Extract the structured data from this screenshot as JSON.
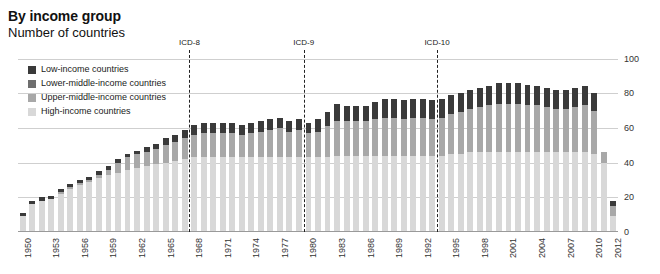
{
  "header": {
    "title": "By income group",
    "subtitle": "Number of countries"
  },
  "legend": {
    "position": "top-left-inside",
    "items": [
      {
        "label": "Low-income countries",
        "color": "#3a3a3a",
        "key": "low"
      },
      {
        "label": "Lower-middle-income countries",
        "color": "#6e6e6e",
        "key": "lower_middle"
      },
      {
        "label": "Upper-middle-income countries",
        "color": "#a8a8a8",
        "key": "upper_middle"
      },
      {
        "label": "High-income countries",
        "color": "#d8d8d8",
        "key": "high"
      }
    ]
  },
  "annotations": [
    {
      "label": "ICD-8",
      "year": 1968
    },
    {
      "label": "ICD-9",
      "year": 1980
    },
    {
      "label": "ICD-10",
      "year": 1994
    }
  ],
  "axis": {
    "y_ticks": [
      "0",
      "20",
      "40",
      "60",
      "80",
      "100"
    ],
    "y_label": "",
    "x_ticks": [
      "1950",
      "1953",
      "1956",
      "1959",
      "1962",
      "1965",
      "1968",
      "1971",
      "1974",
      "1977",
      "1980",
      "1983",
      "1986",
      "1989",
      "1992",
      "1995",
      "1998",
      "2001",
      "2004",
      "2007",
      "2010",
      "2012"
    ],
    "x_label": ""
  },
  "chart_data": {
    "type": "bar",
    "stacked": true,
    "title": "By income group",
    "subtitle": "Number of countries",
    "xlabel": "",
    "ylabel": "Number of countries",
    "ylim": [
      0,
      105
    ],
    "ytick_values": [
      0,
      20,
      40,
      60,
      80,
      100
    ],
    "grid": true,
    "legend_position": "inside top-left",
    "categories": [
      1950,
      1951,
      1952,
      1953,
      1954,
      1955,
      1956,
      1957,
      1958,
      1959,
      1960,
      1961,
      1962,
      1963,
      1964,
      1965,
      1966,
      1967,
      1968,
      1969,
      1970,
      1971,
      1972,
      1973,
      1974,
      1975,
      1976,
      1977,
      1978,
      1979,
      1980,
      1981,
      1982,
      1983,
      1984,
      1985,
      1986,
      1987,
      1988,
      1989,
      1990,
      1991,
      1992,
      1993,
      1994,
      1995,
      1996,
      1997,
      1998,
      1999,
      2000,
      2001,
      2002,
      2003,
      2004,
      2005,
      2006,
      2007,
      2008,
      2009,
      2010,
      2011,
      2012
    ],
    "series": [
      {
        "name": "High-income countries",
        "color": "#d8d8d8",
        "values": [
          9,
          16,
          18,
          19,
          22,
          25,
          27,
          29,
          31,
          33,
          34,
          36,
          37,
          38,
          39,
          40,
          41,
          42,
          43,
          43,
          43,
          43,
          43,
          43,
          43,
          43,
          43,
          43,
          43,
          43,
          43,
          43,
          43,
          44,
          44,
          44,
          44,
          44,
          44,
          44,
          44,
          44,
          44,
          44,
          44,
          45,
          45,
          46,
          46,
          46,
          46,
          46,
          46,
          46,
          46,
          46,
          46,
          46,
          46,
          46,
          45,
          40,
          9
        ]
      },
      {
        "name": "Upper-middle-income countries",
        "color": "#a8a8a8",
        "values": [
          0,
          0,
          0,
          0,
          1,
          1,
          1,
          1,
          2,
          3,
          6,
          7,
          8,
          8,
          9,
          10,
          11,
          12,
          13,
          14,
          14,
          14,
          14,
          13,
          14,
          15,
          16,
          17,
          15,
          16,
          14,
          15,
          18,
          20,
          20,
          20,
          20,
          21,
          22,
          22,
          21,
          22,
          22,
          21,
          22,
          23,
          24,
          25,
          26,
          27,
          28,
          28,
          28,
          27,
          27,
          26,
          25,
          25,
          26,
          27,
          25,
          6,
          6
        ]
      },
      {
        "name": "Lower-middle-income countries",
        "color": "#6e6e6e",
        "values": [
          0,
          0,
          0,
          0,
          0,
          0,
          0,
          0,
          0,
          0,
          0,
          0,
          0,
          0,
          0,
          0,
          0,
          0,
          0,
          0,
          0,
          0,
          0,
          0,
          0,
          0,
          0,
          0,
          0,
          0,
          0,
          0,
          0,
          0,
          0,
          0,
          0,
          0,
          0,
          0,
          0,
          0,
          0,
          0,
          0,
          0,
          0,
          0,
          0,
          0,
          0,
          0,
          0,
          0,
          0,
          0,
          0,
          0,
          0,
          0,
          0,
          0,
          0
        ]
      },
      {
        "name": "Low-income countries",
        "color": "#3a3a3a",
        "values": [
          2,
          2,
          2,
          2,
          2,
          2,
          2,
          2,
          2,
          2,
          2,
          2,
          2,
          3,
          3,
          4,
          4,
          5,
          6,
          6,
          6,
          6,
          6,
          6,
          6,
          6,
          6,
          6,
          6,
          6,
          6,
          7,
          8,
          10,
          9,
          9,
          9,
          10,
          11,
          11,
          11,
          11,
          11,
          11,
          11,
          11,
          11,
          11,
          11,
          11,
          12,
          12,
          12,
          12,
          11,
          11,
          11,
          11,
          11,
          11,
          10,
          0,
          3
        ]
      }
    ],
    "totals": [
      11,
      18,
      20,
      21,
      25,
      28,
      30,
      32,
      35,
      38,
      42,
      45,
      47,
      49,
      51,
      54,
      56,
      59,
      62,
      63,
      63,
      63,
      63,
      62,
      63,
      64,
      65,
      66,
      64,
      65,
      63,
      65,
      69,
      74,
      73,
      73,
      73,
      75,
      77,
      77,
      76,
      77,
      77,
      76,
      77,
      79,
      80,
      82,
      83,
      84,
      86,
      86,
      86,
      85,
      84,
      83,
      82,
      82,
      83,
      84,
      80,
      46,
      18
    ]
  },
  "bars": [
    {
      "year": 1950,
      "high": 9,
      "upper_middle": 0,
      "lower_middle": 0,
      "low": 2,
      "total": 11
    },
    {
      "year": 1951,
      "high": 16,
      "upper_middle": 0,
      "lower_middle": 0,
      "low": 2,
      "total": 18
    },
    {
      "year": 1952,
      "high": 18,
      "upper_middle": 0,
      "lower_middle": 0,
      "low": 2,
      "total": 20
    },
    {
      "year": 1953,
      "high": 19,
      "upper_middle": 0,
      "lower_middle": 0,
      "low": 2,
      "total": 21
    },
    {
      "year": 1954,
      "high": 22,
      "upper_middle": 1,
      "lower_middle": 0,
      "low": 2,
      "total": 25
    },
    {
      "year": 1955,
      "high": 25,
      "upper_middle": 1,
      "lower_middle": 0,
      "low": 2,
      "total": 28
    },
    {
      "year": 1956,
      "high": 27,
      "upper_middle": 1,
      "lower_middle": 0,
      "low": 2,
      "total": 30
    },
    {
      "year": 1957,
      "high": 29,
      "upper_middle": 1,
      "lower_middle": 0,
      "low": 2,
      "total": 32
    },
    {
      "year": 1958,
      "high": 31,
      "upper_middle": 2,
      "lower_middle": 0,
      "low": 2,
      "total": 35
    },
    {
      "year": 1959,
      "high": 33,
      "upper_middle": 3,
      "lower_middle": 0,
      "low": 2,
      "total": 38
    },
    {
      "year": 1960,
      "high": 34,
      "upper_middle": 6,
      "lower_middle": 0,
      "low": 2,
      "total": 42
    },
    {
      "year": 1961,
      "high": 36,
      "upper_middle": 7,
      "lower_middle": 0,
      "low": 2,
      "total": 45
    },
    {
      "year": 1962,
      "high": 37,
      "upper_middle": 8,
      "lower_middle": 0,
      "low": 2,
      "total": 47
    },
    {
      "year": 1963,
      "high": 38,
      "upper_middle": 8,
      "lower_middle": 0,
      "low": 3,
      "total": 49
    },
    {
      "year": 1964,
      "high": 39,
      "upper_middle": 9,
      "lower_middle": 0,
      "low": 3,
      "total": 51
    },
    {
      "year": 1965,
      "high": 40,
      "upper_middle": 10,
      "lower_middle": 0,
      "low": 4,
      "total": 54
    },
    {
      "year": 1966,
      "high": 41,
      "upper_middle": 11,
      "lower_middle": 0,
      "low": 4,
      "total": 56
    },
    {
      "year": 1967,
      "high": 42,
      "upper_middle": 12,
      "lower_middle": 0,
      "low": 5,
      "total": 59
    },
    {
      "year": 1968,
      "high": 43,
      "upper_middle": 13,
      "lower_middle": 0,
      "low": 6,
      "total": 62
    },
    {
      "year": 1969,
      "high": 43,
      "upper_middle": 14,
      "lower_middle": 0,
      "low": 6,
      "total": 63
    },
    {
      "year": 1970,
      "high": 43,
      "upper_middle": 14,
      "lower_middle": 0,
      "low": 6,
      "total": 63
    },
    {
      "year": 1971,
      "high": 43,
      "upper_middle": 14,
      "lower_middle": 0,
      "low": 6,
      "total": 63
    },
    {
      "year": 1972,
      "high": 43,
      "upper_middle": 14,
      "lower_middle": 0,
      "low": 6,
      "total": 63
    },
    {
      "year": 1973,
      "high": 43,
      "upper_middle": 13,
      "lower_middle": 0,
      "low": 6,
      "total": 62
    },
    {
      "year": 1974,
      "high": 43,
      "upper_middle": 14,
      "lower_middle": 0,
      "low": 6,
      "total": 63
    },
    {
      "year": 1975,
      "high": 43,
      "upper_middle": 15,
      "lower_middle": 0,
      "low": 6,
      "total": 64
    },
    {
      "year": 1976,
      "high": 43,
      "upper_middle": 16,
      "lower_middle": 0,
      "low": 6,
      "total": 65
    },
    {
      "year": 1977,
      "high": 43,
      "upper_middle": 17,
      "lower_middle": 0,
      "low": 6,
      "total": 66
    },
    {
      "year": 1978,
      "high": 43,
      "upper_middle": 15,
      "lower_middle": 0,
      "low": 6,
      "total": 64
    },
    {
      "year": 1979,
      "high": 43,
      "upper_middle": 16,
      "lower_middle": 0,
      "low": 6,
      "total": 65
    },
    {
      "year": 1980,
      "high": 43,
      "upper_middle": 14,
      "lower_middle": 0,
      "low": 6,
      "total": 63
    },
    {
      "year": 1981,
      "high": 43,
      "upper_middle": 15,
      "lower_middle": 0,
      "low": 7,
      "total": 65
    },
    {
      "year": 1982,
      "high": 43,
      "upper_middle": 18,
      "lower_middle": 0,
      "low": 8,
      "total": 69
    },
    {
      "year": 1983,
      "high": 44,
      "upper_middle": 20,
      "lower_middle": 0,
      "low": 10,
      "total": 74
    },
    {
      "year": 1984,
      "high": 44,
      "upper_middle": 20,
      "lower_middle": 0,
      "low": 9,
      "total": 73
    },
    {
      "year": 1985,
      "high": 44,
      "upper_middle": 20,
      "lower_middle": 0,
      "low": 9,
      "total": 73
    },
    {
      "year": 1986,
      "high": 44,
      "upper_middle": 20,
      "lower_middle": 0,
      "low": 9,
      "total": 73
    },
    {
      "year": 1987,
      "high": 44,
      "upper_middle": 21,
      "lower_middle": 0,
      "low": 10,
      "total": 75
    },
    {
      "year": 1988,
      "high": 44,
      "upper_middle": 22,
      "lower_middle": 0,
      "low": 11,
      "total": 77
    },
    {
      "year": 1989,
      "high": 44,
      "upper_middle": 22,
      "lower_middle": 0,
      "low": 11,
      "total": 77
    },
    {
      "year": 1990,
      "high": 44,
      "upper_middle": 21,
      "lower_middle": 0,
      "low": 11,
      "total": 76
    },
    {
      "year": 1991,
      "high": 44,
      "upper_middle": 22,
      "lower_middle": 0,
      "low": 11,
      "total": 77
    },
    {
      "year": 1992,
      "high": 44,
      "upper_middle": 22,
      "lower_middle": 0,
      "low": 11,
      "total": 77
    },
    {
      "year": 1993,
      "high": 44,
      "upper_middle": 21,
      "lower_middle": 0,
      "low": 11,
      "total": 76
    },
    {
      "year": 1994,
      "high": 44,
      "upper_middle": 22,
      "lower_middle": 0,
      "low": 11,
      "total": 77
    },
    {
      "year": 1995,
      "high": 45,
      "upper_middle": 23,
      "lower_middle": 0,
      "low": 11,
      "total": 79
    },
    {
      "year": 1996,
      "high": 45,
      "upper_middle": 24,
      "lower_middle": 0,
      "low": 11,
      "total": 80
    },
    {
      "year": 1997,
      "high": 46,
      "upper_middle": 25,
      "lower_middle": 0,
      "low": 11,
      "total": 82
    },
    {
      "year": 1998,
      "high": 46,
      "upper_middle": 26,
      "lower_middle": 0,
      "low": 11,
      "total": 83
    },
    {
      "year": 1999,
      "high": 46,
      "upper_middle": 27,
      "lower_middle": 0,
      "low": 11,
      "total": 84
    },
    {
      "year": 2000,
      "high": 46,
      "upper_middle": 28,
      "lower_middle": 0,
      "low": 12,
      "total": 86
    },
    {
      "year": 2001,
      "high": 46,
      "upper_middle": 28,
      "lower_middle": 0,
      "low": 12,
      "total": 86
    },
    {
      "year": 2002,
      "high": 46,
      "upper_middle": 28,
      "lower_middle": 0,
      "low": 12,
      "total": 86
    },
    {
      "year": 2003,
      "high": 46,
      "upper_middle": 27,
      "lower_middle": 0,
      "low": 12,
      "total": 85
    },
    {
      "year": 2004,
      "high": 46,
      "upper_middle": 27,
      "lower_middle": 0,
      "low": 11,
      "total": 84
    },
    {
      "year": 2005,
      "high": 46,
      "upper_middle": 26,
      "lower_middle": 0,
      "low": 11,
      "total": 83
    },
    {
      "year": 2006,
      "high": 46,
      "upper_middle": 25,
      "lower_middle": 0,
      "low": 11,
      "total": 82
    },
    {
      "year": 2007,
      "high": 46,
      "upper_middle": 25,
      "lower_middle": 0,
      "low": 11,
      "total": 82
    },
    {
      "year": 2008,
      "high": 46,
      "upper_middle": 26,
      "lower_middle": 0,
      "low": 11,
      "total": 83
    },
    {
      "year": 2009,
      "high": 46,
      "upper_middle": 27,
      "lower_middle": 0,
      "low": 11,
      "total": 84
    },
    {
      "year": 2010,
      "high": 45,
      "upper_middle": 25,
      "lower_middle": 0,
      "low": 10,
      "total": 80
    },
    {
      "year": 2011,
      "high": 40,
      "upper_middle": 6,
      "lower_middle": 0,
      "low": 0,
      "total": 46
    },
    {
      "year": 2012,
      "high": 9,
      "upper_middle": 6,
      "lower_middle": 0,
      "low": 3,
      "total": 18
    }
  ]
}
